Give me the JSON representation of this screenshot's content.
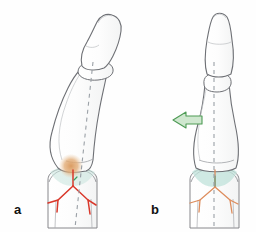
{
  "figure": {
    "kind": "medical-illustration",
    "background_color": "#fefefe",
    "panel_count": 2
  },
  "panels": [
    {
      "id": "a",
      "label": "a",
      "label_position": {
        "x": 14,
        "y": 203
      },
      "description": "angulated / displaced phalanx with fracture",
      "bone_outline_color": "#6e7075",
      "bone_fill_color": "#fdfdfd",
      "axis_line": {
        "style": "dashed",
        "color": "#9aa0a6",
        "orientation": "tilted",
        "x1": 92,
        "y1": 62,
        "x2": 76,
        "y2": 228
      },
      "markers": {
        "hematoma_blob": {
          "color": "#e0a86a",
          "cx": 71,
          "cy": 166,
          "r": 11
        },
        "fracture_lines_color": "#d9382b",
        "joint_space_color": "#b9dfd8"
      },
      "has_arrow": false
    },
    {
      "id": "b",
      "label": "b",
      "label_position": {
        "x": 151,
        "y": 203
      },
      "description": "reduced / realigned phalanx after correction",
      "bone_outline_color": "#6e7075",
      "bone_fill_color": "#fdfdfd",
      "axis_line": {
        "style": "dashed",
        "color": "#9aa0a6",
        "orientation": "vertical",
        "x1": 214,
        "y1": 62,
        "x2": 214,
        "y2": 228
      },
      "markers": {
        "fracture_lines_color": "#dd8c5c",
        "joint_space_color": "#bfe2da"
      },
      "has_arrow": true,
      "arrow": {
        "name": "reduction-force-arrow",
        "direction": "left",
        "fill_color": "#cfe7cf",
        "stroke_color": "#4e9b55",
        "x": 172,
        "y": 114,
        "width": 30,
        "height": 13
      }
    }
  ],
  "colors": {
    "outline": "#6e7075",
    "bone_fill": "#fdfdfd",
    "axis_dash": "#9aa0a6",
    "fracture_red": "#d9382b",
    "fracture_orange": "#dd8c5c",
    "hematoma": "#e0a86a",
    "joint_teal": "#b9dfd8",
    "arrow_fill": "#cfe7cf",
    "arrow_stroke": "#4e9b55",
    "label_text": "#111111"
  }
}
